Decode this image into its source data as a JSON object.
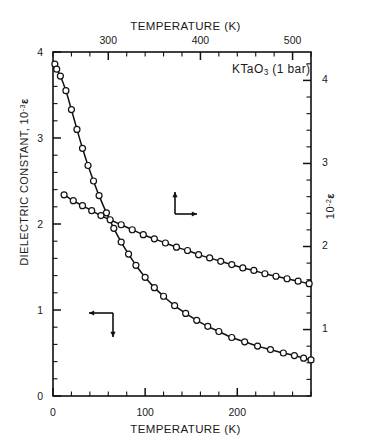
{
  "figure": {
    "top_axis_title": "TEMPERATURE (K)",
    "bottom_axis_title": "TEMPERATURE (K)",
    "left_axis_title": "DIELECTRIC CONSTANT,  10",
    "left_axis_exponent": "-3",
    "left_axis_symbol": "ε",
    "right_axis_title": "10",
    "right_axis_exponent": "-2",
    "right_axis_symbol": "ε",
    "sample_label_pre": "KTaO",
    "sample_label_sub": "3",
    "sample_label_post": " (1 bar)",
    "line_color": "#111111",
    "marker_fill": "#ffffff",
    "axis_color": "#111111"
  },
  "chart_data": {
    "type": "line",
    "title": "KTaO3 (1 bar)",
    "xlabel": "TEMPERATURE (K)",
    "ylabel": "DIELECTRIC CONSTANT, 10^-3 e",
    "grid": false,
    "legend": null,
    "axes": {
      "bottom": {
        "label": "TEMPERATURE (K)",
        "min": 0,
        "max": 280,
        "major_ticks": [
          0,
          100,
          200
        ],
        "tick_labels": [
          "0",
          "100",
          "200"
        ],
        "minor_step": 20
      },
      "top": {
        "label": "TEMPERATURE (K)",
        "min": 240,
        "max": 520,
        "major_ticks": [
          300,
          400,
          500
        ],
        "tick_labels": [
          "300",
          "400",
          "500"
        ],
        "minor_step": 20
      },
      "left": {
        "label": "DIELECTRIC CONSTANT, 10^-3 epsilon",
        "min": 0,
        "max": 4,
        "major_ticks": [
          0,
          1,
          2,
          3,
          4
        ],
        "tick_labels": [
          "0",
          "1",
          "2",
          "3",
          "4"
        ],
        "minor_step": 0.2
      },
      "right": {
        "label": "10^-2 epsilon",
        "min": 0.178,
        "max": 4.32,
        "major_ticks": [
          1,
          2,
          3,
          4
        ],
        "tick_labels": [
          "1",
          "2",
          "3",
          "4"
        ],
        "minor_step": 0.2
      }
    },
    "annotations": [
      {
        "name": "upper-curve-arrow",
        "text": "arrow up and right to right axis",
        "x_px": 175,
        "y_px": 200
      },
      {
        "name": "lower-curve-arrow",
        "text": "arrow down and left to left axis",
        "x_px": 113,
        "y_px": 325
      }
    ],
    "series": [
      {
        "name": "low-temperature branch (left axis, bottom T scale)",
        "axis": "left-bottom",
        "marker": "open-circle",
        "points": [
          [
            2,
            3.86
          ],
          [
            4,
            3.8
          ],
          [
            8,
            3.72
          ],
          [
            14,
            3.55
          ],
          [
            20,
            3.33
          ],
          [
            26,
            3.1
          ],
          [
            32,
            2.88
          ],
          [
            38,
            2.68
          ],
          [
            44,
            2.5
          ],
          [
            50,
            2.33
          ],
          [
            58,
            2.13
          ],
          [
            66,
            1.95
          ],
          [
            74,
            1.79
          ],
          [
            82,
            1.65
          ],
          [
            90,
            1.52
          ],
          [
            100,
            1.38
          ],
          [
            110,
            1.26
          ],
          [
            120,
            1.16
          ],
          [
            132,
            1.05
          ],
          [
            144,
            0.96
          ],
          [
            156,
            0.88
          ],
          [
            168,
            0.81
          ],
          [
            180,
            0.75
          ],
          [
            194,
            0.68
          ],
          [
            208,
            0.63
          ],
          [
            222,
            0.58
          ],
          [
            236,
            0.54
          ],
          [
            250,
            0.5
          ],
          [
            262,
            0.47
          ],
          [
            272,
            0.44
          ],
          [
            280,
            0.42
          ]
        ]
      },
      {
        "name": "high-temperature branch (right axis, top T scale)",
        "axis": "right-top",
        "marker": "open-circle",
        "points": [
          [
            252,
            2.6
          ],
          [
            262,
            2.53
          ],
          [
            272,
            2.47
          ],
          [
            282,
            2.41
          ],
          [
            292,
            2.35
          ],
          [
            302,
            2.3
          ],
          [
            314,
            2.24
          ],
          [
            326,
            2.18
          ],
          [
            338,
            2.12
          ],
          [
            350,
            2.07
          ],
          [
            362,
            2.02
          ],
          [
            374,
            1.97
          ],
          [
            386,
            1.93
          ],
          [
            398,
            1.88
          ],
          [
            410,
            1.84
          ],
          [
            422,
            1.8
          ],
          [
            434,
            1.76
          ],
          [
            446,
            1.72
          ],
          [
            458,
            1.69
          ],
          [
            470,
            1.65
          ],
          [
            482,
            1.62
          ],
          [
            494,
            1.59
          ],
          [
            506,
            1.56
          ],
          [
            518,
            1.53
          ]
        ]
      }
    ]
  }
}
